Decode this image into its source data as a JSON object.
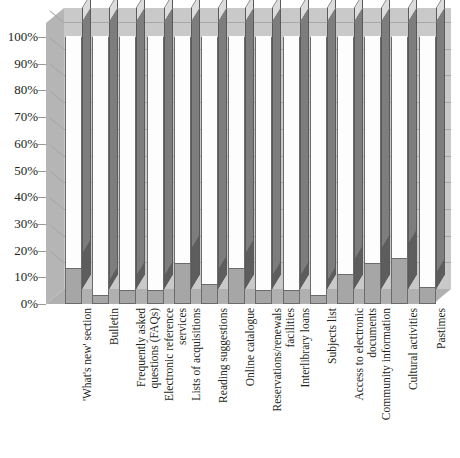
{
  "chart_data": {
    "type": "bar",
    "title": "",
    "subtitle": "",
    "xlabel": "",
    "ylabel": "",
    "ylim": [
      0,
      100
    ],
    "grid": true,
    "legend": "none",
    "style": "3d-stacked-column-100-percent",
    "y_ticks": [
      "0%",
      "10%",
      "20%",
      "30%",
      "40%",
      "50%",
      "60%",
      "70%",
      "80%",
      "90%",
      "100%"
    ],
    "categories": [
      "'What's new' section",
      "Bulletin",
      "Frequently asked questions (FAQs)",
      "Electronic reference services",
      "Lists of acquisitions",
      "Reading suggestions",
      "Online catalogue",
      "Reservations/renewals facilities",
      "Interlibrary loans",
      "Subjects list",
      "Access to electronic documents",
      "Community information",
      "Cultural activities",
      "Pastimes"
    ],
    "category_lines": [
      [
        "'What's new' section"
      ],
      [
        "Bulletin"
      ],
      [
        "Frequently asked",
        "questions (FAQs)"
      ],
      [
        "Electronic reference",
        "services"
      ],
      [
        "Lists of acquisitions"
      ],
      [
        "Reading suggestions"
      ],
      [
        "Online catalogue"
      ],
      [
        "Reservations/renewals",
        "facilities"
      ],
      [
        "Interlibrary loans"
      ],
      [
        "Subjects list"
      ],
      [
        "Access to electronic",
        "documents"
      ],
      [
        "Community information"
      ],
      [
        "Cultural activities"
      ],
      [
        "Pastimes"
      ]
    ],
    "series": [
      {
        "name": "lower-segment",
        "color": "#a6a6a6",
        "values": [
          13,
          3,
          5,
          5,
          15,
          7,
          13,
          5,
          5,
          3,
          11,
          15,
          17,
          6
        ]
      },
      {
        "name": "upper-segment",
        "color": "#fdfdfd",
        "values": [
          87,
          97,
          95,
          95,
          85,
          93,
          87,
          95,
          95,
          97,
          89,
          85,
          83,
          94
        ]
      }
    ]
  },
  "colors": {
    "back_wall": "#c9c9c9",
    "left_wall": "#b5b5b5",
    "floor": "#b0b0b0",
    "bar_upper": "#fdfdfd",
    "bar_lower": "#a6a6a6",
    "bar_side": "#7d7d7d",
    "bar_side_lower": "#5d5d5d",
    "axis_text": "#231f20",
    "gridline": "#a8a8a8"
  }
}
